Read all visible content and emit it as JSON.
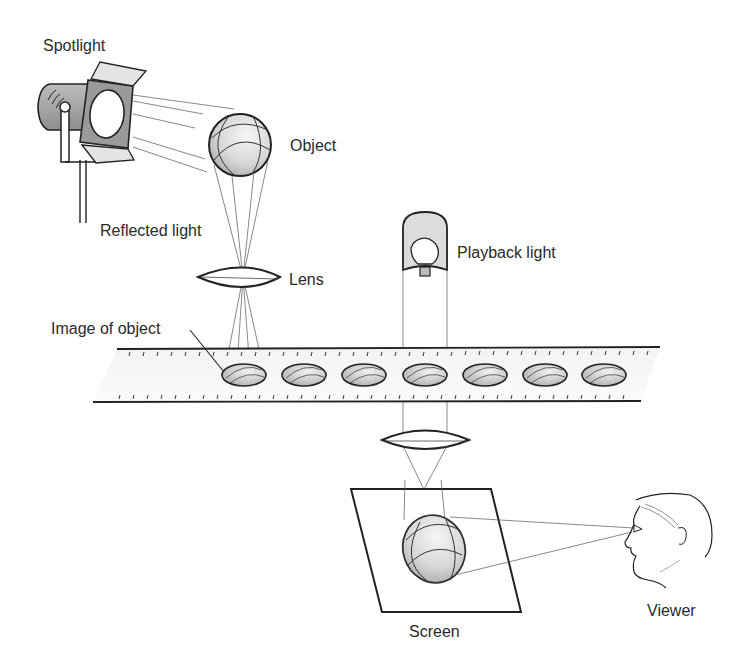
{
  "diagram": {
    "labels": {
      "spotlight": "Spotlight",
      "object": "Object",
      "reflected_light": "Reflected light",
      "lens": "Lens",
      "playback_light": "Playback light",
      "image_of_object": "Image of object",
      "screen": "Screen",
      "viewer": "Viewer"
    },
    "colors": {
      "line": "#222222",
      "ray": "#555555",
      "shade": "#d4d4d4",
      "label": "#2a2a2a"
    },
    "film_frames": 7
  }
}
